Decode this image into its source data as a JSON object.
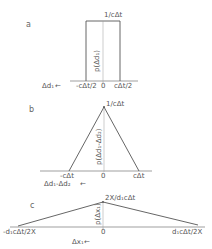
{
  "panels": {
    "a": {
      "label": "a",
      "peak_label": "1/cΔt",
      "axis_var_label": "p(Δd₁)",
      "x_axis_label": "Δd₁",
      "ticks": [
        "-cΔt/2",
        "0",
        "cΔt/2"
      ],
      "shape": "rectangle"
    },
    "b": {
      "label": "b",
      "peak_label": "1/cΔt",
      "axis_var_label": "p(Δd₁-Δd₂)",
      "x_axis_label": "Δd₁-Δd₂",
      "ticks": [
        "-cΔt",
        "0",
        "cΔt"
      ],
      "shape": "triangle"
    },
    "c": {
      "label": "c",
      "peak_label": "2X/d₁cΔt",
      "axis_var_label": "p(Δx₁)",
      "x_axis_label": "Δx₁",
      "ticks": [
        "-d₁cΔt/2X",
        "0",
        "d₁cΔt/2X"
      ],
      "shape": "wide-triangle"
    }
  },
  "arrow_glyph": "←"
}
